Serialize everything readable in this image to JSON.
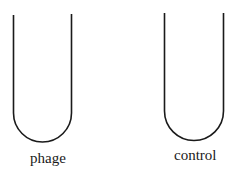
{
  "diagram": {
    "tubes": [
      {
        "id": "phage",
        "label": "phage"
      },
      {
        "id": "control",
        "label": "control"
      }
    ],
    "stroke_color": "#1a1a1a"
  }
}
